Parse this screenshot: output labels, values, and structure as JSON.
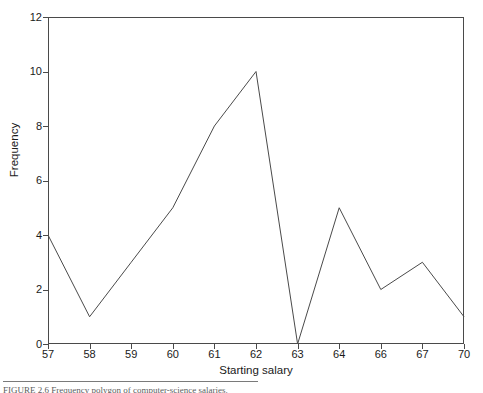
{
  "figure": {
    "caption_text": "FIGURE 2.6    Frequency polygon of computer-science salaries."
  },
  "chart_data": {
    "type": "line",
    "title": "",
    "subtitle": "",
    "xlabel": "Starting salary",
    "ylabel": "Frequency",
    "categories": [
      "57",
      "58",
      "59",
      "60",
      "61",
      "62",
      "63",
      "64",
      "66",
      "67",
      "70"
    ],
    "values": [
      4,
      1,
      3,
      5,
      8,
      10,
      0,
      5,
      2,
      3,
      1
    ],
    "series": [
      {
        "name": "Frequency",
        "values": [
          4,
          1,
          3,
          5,
          8,
          10,
          0,
          5,
          2,
          3,
          1
        ]
      }
    ],
    "ylim": [
      0,
      12
    ],
    "yticks": [
      "0",
      "2",
      "4",
      "6",
      "8",
      "10",
      "12"
    ],
    "ytick_values": [
      0,
      2,
      4,
      6,
      8,
      10,
      12
    ],
    "xticks": [
      "57",
      "58",
      "59",
      "60",
      "61",
      "62",
      "63",
      "64",
      "66",
      "67",
      "70"
    ],
    "grid": false,
    "legend": "none",
    "line_color": "#4a4a4a",
    "background_color": "#ffffff",
    "axis_color": "#4a4a4a"
  }
}
